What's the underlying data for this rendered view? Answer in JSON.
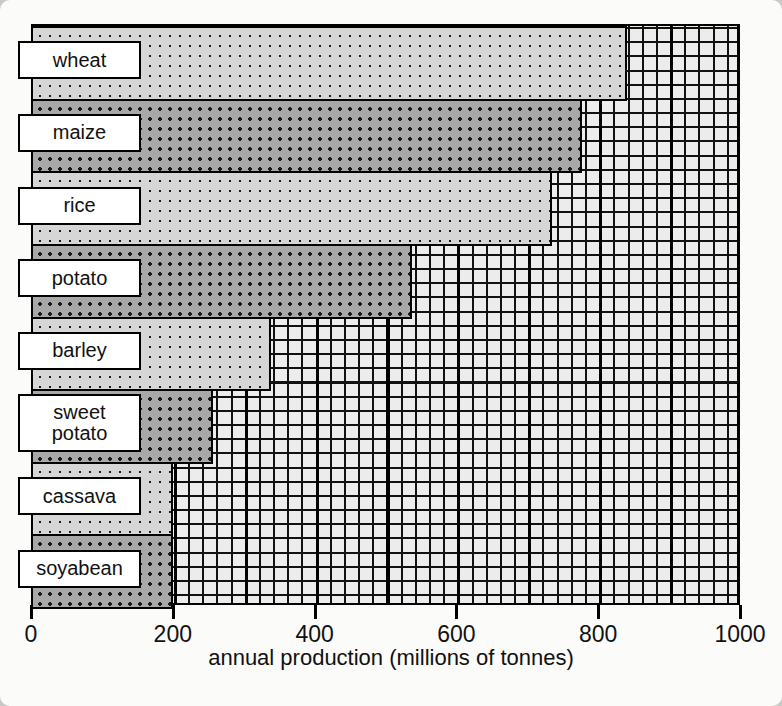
{
  "chart_data": {
    "type": "bar",
    "orientation": "horizontal",
    "title": "",
    "xlabel": "annual production (millions of tonnes)",
    "ylabel": "",
    "xlim": [
      0,
      1000
    ],
    "xticks": [
      0,
      200,
      400,
      600,
      800,
      1000
    ],
    "xtick_labels": [
      "0",
      "200",
      "400",
      "600",
      "800",
      "1000"
    ],
    "grid": true,
    "grid_minor_step": 20,
    "grid_major_step": 100,
    "legend": "none",
    "categories": [
      "wheat",
      "maize",
      "rice",
      "potato",
      "barley",
      "sweet potato",
      "cassava",
      "soyabean"
    ],
    "values": [
      838,
      774,
      732,
      535,
      336,
      254,
      198,
      197
    ],
    "bars": [
      {
        "label": "wheat",
        "value": 838,
        "shade": "light"
      },
      {
        "label": "maize",
        "value": 774,
        "shade": "dark"
      },
      {
        "label": "rice",
        "value": 732,
        "shade": "light"
      },
      {
        "label": "potato",
        "value": 535,
        "shade": "dark"
      },
      {
        "label": "barley",
        "value": 336,
        "shade": "light"
      },
      {
        "label": "sweet\npotato",
        "value": 254,
        "shade": "dark"
      },
      {
        "label": "cassava",
        "value": 198,
        "shade": "light"
      },
      {
        "label": "soyabean",
        "value": 197,
        "shade": "dark"
      }
    ],
    "colors": {
      "light_bar": "#d6d6d6",
      "dark_bar": "#a8a8a8",
      "grid_fill": "#ececec",
      "line": "#000000",
      "label_box": "#ffffff",
      "background": "#fbfbfa"
    }
  }
}
